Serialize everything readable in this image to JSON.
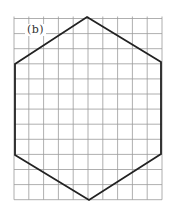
{
  "figure": {
    "label": "(b)",
    "grid": {
      "x0": 14,
      "y0": 18.5,
      "cols": 10,
      "rows": 12,
      "cell_w": 14.8,
      "cell_h": 15.1,
      "line_color": "#9a9a9a"
    },
    "shape": {
      "type": "hexagon",
      "stroke": "#222222",
      "vertices": [
        [
          87,
          17
        ],
        [
          161,
          62
        ],
        [
          161,
          154
        ],
        [
          89,
          200
        ],
        [
          15,
          155
        ],
        [
          15,
          64
        ]
      ]
    }
  }
}
